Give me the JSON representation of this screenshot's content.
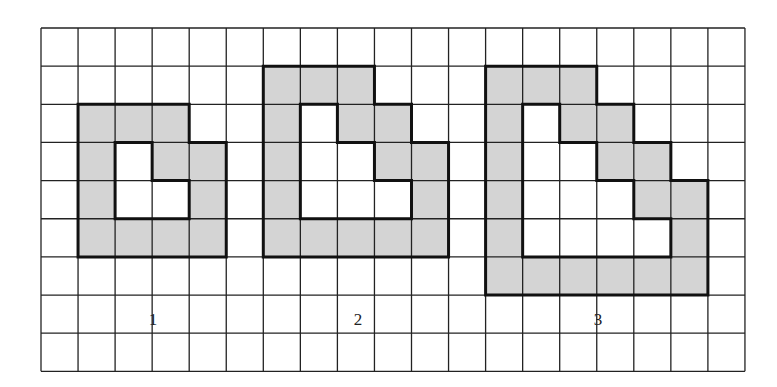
{
  "grid": {
    "cols": 19,
    "rows": 9,
    "origin_x": 41,
    "origin_y": 28,
    "cell_w": 37.05,
    "cell_h": 38.15,
    "line_color": "#222222",
    "fill_color": "#d4d4d4",
    "background": "#ffffff"
  },
  "figures": [
    {
      "label": "1",
      "label_pos": {
        "x": 153,
        "y": 320
      },
      "shaded_cells": [
        [
          2,
          1
        ],
        [
          2,
          2
        ],
        [
          2,
          3
        ],
        [
          3,
          1
        ],
        [
          3,
          3
        ],
        [
          3,
          4
        ],
        [
          4,
          1
        ],
        [
          4,
          4
        ],
        [
          5,
          1
        ],
        [
          5,
          2
        ],
        [
          5,
          3
        ],
        [
          5,
          4
        ]
      ],
      "outer": [
        [
          1,
          2
        ],
        [
          4,
          2
        ],
        [
          4,
          3
        ],
        [
          5,
          3
        ],
        [
          5,
          6
        ],
        [
          1,
          6
        ]
      ],
      "inner": [
        [
          2,
          3
        ],
        [
          3,
          3
        ],
        [
          3,
          4
        ],
        [
          4,
          4
        ],
        [
          4,
          5
        ],
        [
          2,
          5
        ]
      ]
    },
    {
      "label": "2",
      "label_pos": {
        "x": 358,
        "y": 320
      },
      "shaded_cells": [
        [
          1,
          6
        ],
        [
          1,
          7
        ],
        [
          1,
          8
        ],
        [
          2,
          6
        ],
        [
          2,
          8
        ],
        [
          2,
          9
        ],
        [
          3,
          6
        ],
        [
          3,
          9
        ],
        [
          3,
          10
        ],
        [
          4,
          6
        ],
        [
          4,
          10
        ],
        [
          5,
          6
        ],
        [
          5,
          7
        ],
        [
          5,
          8
        ],
        [
          5,
          9
        ],
        [
          5,
          10
        ]
      ],
      "outer": [
        [
          6,
          1
        ],
        [
          9,
          1
        ],
        [
          9,
          2
        ],
        [
          10,
          2
        ],
        [
          10,
          3
        ],
        [
          11,
          3
        ],
        [
          11,
          6
        ],
        [
          6,
          6
        ]
      ],
      "inner": [
        [
          7,
          2
        ],
        [
          8,
          2
        ],
        [
          8,
          3
        ],
        [
          9,
          3
        ],
        [
          9,
          4
        ],
        [
          10,
          4
        ],
        [
          10,
          5
        ],
        [
          7,
          5
        ]
      ]
    },
    {
      "label": "3",
      "label_pos": {
        "x": 598,
        "y": 320
      },
      "shaded_cells": [
        [
          1,
          12
        ],
        [
          1,
          13
        ],
        [
          1,
          14
        ],
        [
          2,
          12
        ],
        [
          2,
          14
        ],
        [
          2,
          15
        ],
        [
          3,
          12
        ],
        [
          3,
          15
        ],
        [
          3,
          16
        ],
        [
          4,
          12
        ],
        [
          4,
          16
        ],
        [
          4,
          17
        ],
        [
          5,
          12
        ],
        [
          5,
          17
        ],
        [
          6,
          12
        ],
        [
          6,
          13
        ],
        [
          6,
          14
        ],
        [
          6,
          15
        ],
        [
          6,
          16
        ],
        [
          6,
          17
        ]
      ],
      "outer": [
        [
          12,
          1
        ],
        [
          15,
          1
        ],
        [
          15,
          2
        ],
        [
          16,
          2
        ],
        [
          16,
          3
        ],
        [
          17,
          3
        ],
        [
          17,
          4
        ],
        [
          18,
          4
        ],
        [
          18,
          7
        ],
        [
          12,
          7
        ]
      ],
      "inner": [
        [
          13,
          2
        ],
        [
          14,
          2
        ],
        [
          14,
          3
        ],
        [
          15,
          3
        ],
        [
          15,
          4
        ],
        [
          16,
          4
        ],
        [
          16,
          5
        ],
        [
          17,
          5
        ],
        [
          17,
          6
        ],
        [
          13,
          6
        ]
      ]
    }
  ]
}
